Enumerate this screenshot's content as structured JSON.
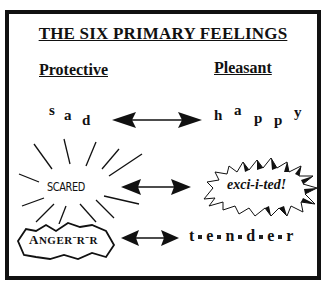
{
  "title": "THE SIX PRIMARY FEELINGS",
  "columns": {
    "left": "Protective",
    "right": "Pleasant"
  },
  "pairs": [
    {
      "protective": {
        "word": "sad",
        "letters": [
          "s",
          "a",
          "d"
        ],
        "style": "scattered-letters"
      },
      "pleasant": {
        "word": "happy",
        "letters": [
          "h",
          "a",
          "p",
          "p",
          "y"
        ],
        "style": "scattered-letters"
      },
      "connector": "double-arrow"
    },
    {
      "protective": {
        "word": "SCARED",
        "style": "radiating-lines"
      },
      "pleasant": {
        "word": "exci-i-ted!",
        "style": "starburst"
      },
      "connector": "double-arrow"
    },
    {
      "protective": {
        "word_first": "A",
        "word_rest": "NGER",
        "suffix": "ˉRˉR",
        "word": "ANGER-R-R",
        "style": "jagged-outline"
      },
      "pleasant": {
        "word": "tender",
        "letters": [
          "t",
          "e",
          "n",
          "d",
          "e",
          "r"
        ],
        "style": "dotted-letters"
      },
      "connector": "double-arrow"
    }
  ],
  "colors": {
    "ink": "#111111",
    "paper": "#ffffff"
  }
}
